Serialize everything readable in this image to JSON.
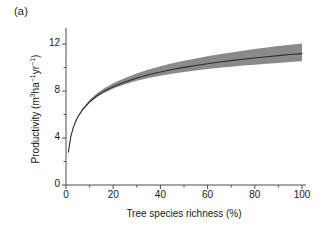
{
  "panel": {
    "label": "(a)"
  },
  "axes": {
    "y_title_main": "Productivity (m",
    "y_title_sup1": "3",
    "y_title_mid": "ha",
    "y_title_sup2": "−1",
    "y_title_mid2": "yr",
    "y_title_sup3": "−1",
    "y_title_end": ")",
    "y_title_plain": "Productivity (m3ha−1yr−1)",
    "x_title": "Tree species richness (%)",
    "y_ticks": [
      "0",
      "4",
      "8",
      "12"
    ],
    "x_ticks": [
      "0",
      "20",
      "40",
      "60",
      "80",
      "100"
    ]
  },
  "colors": {
    "line": "#2b2b2b",
    "band": "#808080",
    "axis": "#4d4d4d",
    "text": "#1a1a1a",
    "background": "#ffffff"
  },
  "chart_data": {
    "type": "line",
    "title": "",
    "subtitle": "",
    "xlabel": "Tree species richness (%)",
    "ylabel": "Productivity (m3ha-1yr-1)",
    "xlim": [
      0,
      100
    ],
    "ylim": [
      0,
      13.2
    ],
    "grid": false,
    "legend": null,
    "annotations": [
      "(a)"
    ],
    "x_major_ticks": [
      0,
      20,
      40,
      60,
      80,
      100
    ],
    "x_minor_ticks": [
      10,
      30,
      50,
      70,
      90
    ],
    "y_major_ticks": [
      0,
      4,
      8,
      12
    ],
    "y_minor_ticks": [
      2,
      6,
      10
    ],
    "series": [
      {
        "name": "fitted productivity",
        "x": [
          1,
          2,
          3,
          4,
          5,
          7,
          10,
          13,
          16,
          20,
          25,
          30,
          35,
          40,
          45,
          50,
          55,
          60,
          65,
          70,
          75,
          80,
          85,
          90,
          95,
          100
        ],
        "values": [
          2.8,
          4.08,
          4.84,
          5.37,
          5.79,
          6.41,
          7.08,
          7.58,
          7.97,
          8.37,
          8.78,
          9.11,
          9.39,
          9.63,
          9.83,
          10.02,
          10.18,
          10.33,
          10.47,
          10.59,
          10.71,
          10.82,
          10.92,
          11.02,
          11.11,
          11.19
        ],
        "ci_lower": [
          2.8,
          4.08,
          4.84,
          5.35,
          5.76,
          6.35,
          7.0,
          7.47,
          7.84,
          8.21,
          8.58,
          8.87,
          9.11,
          9.31,
          9.48,
          9.63,
          9.76,
          9.88,
          9.99,
          10.08,
          10.17,
          10.25,
          10.33,
          10.4,
          10.47,
          10.53
        ],
        "ci_upper": [
          2.8,
          4.1,
          4.88,
          5.43,
          5.87,
          6.52,
          7.24,
          7.79,
          8.22,
          8.66,
          9.12,
          9.5,
          9.83,
          10.11,
          10.36,
          10.58,
          10.78,
          10.96,
          11.13,
          11.29,
          11.44,
          11.58,
          11.71,
          11.83,
          11.95,
          12.06
        ]
      }
    ]
  }
}
